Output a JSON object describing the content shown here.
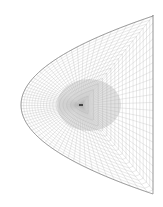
{
  "diagram": {
    "type": "parabolic-mesh",
    "shape": {
      "vertex": [
        21,
        105
      ],
      "right_edge_x": 153,
      "top_y": 15,
      "bottom_y": 193
    },
    "center_mark": [
      81,
      105
    ],
    "colors": {
      "background": "#ffffff",
      "boundary": "#8a8a8a",
      "grid": "#b5b5b5",
      "dense_core": "#a8a8a8",
      "center_mark": "#222222"
    },
    "rings": 18,
    "radials": 40
  }
}
